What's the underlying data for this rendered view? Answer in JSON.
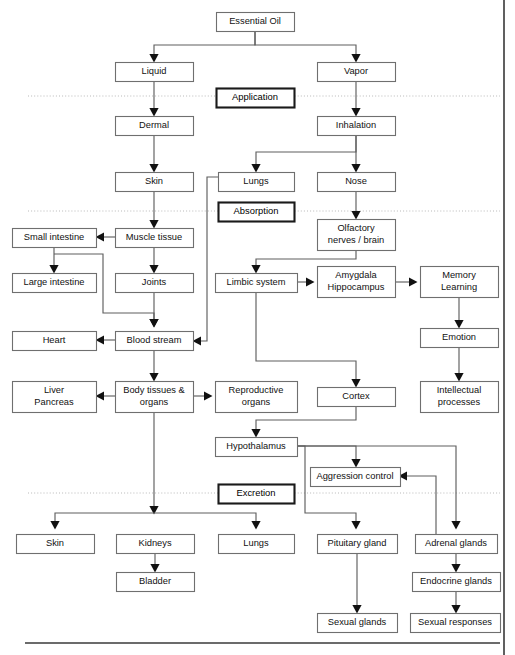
{
  "diagram": {
    "type": "flowchart",
    "canvas": {
      "width": 515,
      "height": 655
    },
    "colors": {
      "background": "#ffffff",
      "node_border": "#6f6f6f",
      "phase_border": "#1a1a1a",
      "link": "#5f5f5f",
      "text": "#111111",
      "divider": "#b9b9b9"
    },
    "nodes": [
      {
        "id": "essential-oil",
        "label": "Essential Oil",
        "x": 216,
        "y": 12,
        "w": 78,
        "h": 19,
        "kind": "node"
      },
      {
        "id": "liquid",
        "label": "Liquid",
        "x": 115,
        "y": 62,
        "w": 78,
        "h": 19,
        "kind": "node"
      },
      {
        "id": "vapor",
        "label": "Vapor",
        "x": 317,
        "y": 62,
        "w": 78,
        "h": 19,
        "kind": "node"
      },
      {
        "id": "application",
        "label": "Application",
        "x": 216,
        "y": 88,
        "w": 78,
        "h": 19,
        "kind": "phase"
      },
      {
        "id": "dermal",
        "label": "Dermal",
        "x": 115,
        "y": 116,
        "w": 78,
        "h": 19,
        "kind": "node"
      },
      {
        "id": "inhalation",
        "label": "Inhalation",
        "x": 317,
        "y": 116,
        "w": 78,
        "h": 19,
        "kind": "node"
      },
      {
        "id": "skin-top",
        "label": "Skin",
        "x": 115,
        "y": 172,
        "w": 78,
        "h": 19,
        "kind": "node"
      },
      {
        "id": "lungs-top",
        "label": "Lungs",
        "x": 218,
        "y": 172,
        "w": 76,
        "h": 19,
        "kind": "node"
      },
      {
        "id": "nose",
        "label": "Nose",
        "x": 317,
        "y": 172,
        "w": 78,
        "h": 19,
        "kind": "node"
      },
      {
        "id": "absorption",
        "label": "Absorption",
        "x": 218,
        "y": 202,
        "w": 76,
        "h": 19,
        "kind": "phase"
      },
      {
        "id": "small-intestine",
        "label": "Small intestine",
        "x": 12,
        "y": 228,
        "w": 84,
        "h": 19,
        "kind": "node"
      },
      {
        "id": "muscle-tissue",
        "label": "Muscle tissue",
        "x": 115,
        "y": 228,
        "w": 78,
        "h": 19,
        "kind": "node"
      },
      {
        "id": "olfactory",
        "label": "Olfactory|nerves / brain",
        "x": 317,
        "y": 219,
        "w": 78,
        "h": 31,
        "kind": "node"
      },
      {
        "id": "large-intestine",
        "label": "Large intestine",
        "x": 12,
        "y": 273,
        "w": 84,
        "h": 19,
        "kind": "node"
      },
      {
        "id": "joints",
        "label": "Joints",
        "x": 115,
        "y": 273,
        "w": 78,
        "h": 19,
        "kind": "node"
      },
      {
        "id": "limbic-system",
        "label": "Limbic system",
        "x": 215,
        "y": 273,
        "w": 82,
        "h": 19,
        "kind": "node"
      },
      {
        "id": "amygdala",
        "label": "Amygdala|Hippocampus",
        "x": 317,
        "y": 266,
        "w": 78,
        "h": 31,
        "kind": "node"
      },
      {
        "id": "memory-learning",
        "label": "Memory|Learning",
        "x": 420,
        "y": 266,
        "w": 78,
        "h": 31,
        "kind": "node"
      },
      {
        "id": "heart",
        "label": "Heart",
        "x": 12,
        "y": 331,
        "w": 84,
        "h": 19,
        "kind": "node"
      },
      {
        "id": "blood-stream",
        "label": "Blood stream",
        "x": 115,
        "y": 331,
        "w": 78,
        "h": 19,
        "kind": "node"
      },
      {
        "id": "emotion",
        "label": "Emotion",
        "x": 420,
        "y": 328,
        "w": 78,
        "h": 19,
        "kind": "node"
      },
      {
        "id": "liver-pancreas",
        "label": "Liver|Pancreas",
        "x": 12,
        "y": 381,
        "w": 84,
        "h": 31,
        "kind": "node"
      },
      {
        "id": "body-tissues",
        "label": "Body tissues &|organs",
        "x": 115,
        "y": 381,
        "w": 78,
        "h": 31,
        "kind": "node"
      },
      {
        "id": "reproductive-organs",
        "label": "Reproductive|organs",
        "x": 215,
        "y": 381,
        "w": 82,
        "h": 31,
        "kind": "node"
      },
      {
        "id": "cortex",
        "label": "Cortex",
        "x": 317,
        "y": 387,
        "w": 78,
        "h": 19,
        "kind": "node"
      },
      {
        "id": "intellectual",
        "label": "Intellectual|processes",
        "x": 420,
        "y": 381,
        "w": 78,
        "h": 31,
        "kind": "node"
      },
      {
        "id": "hypothalamus",
        "label": "Hypothalamus",
        "x": 215,
        "y": 437,
        "w": 82,
        "h": 19,
        "kind": "node"
      },
      {
        "id": "aggression-control",
        "label": "Aggression control",
        "x": 310,
        "y": 467,
        "w": 90,
        "h": 19,
        "kind": "node"
      },
      {
        "id": "excretion",
        "label": "Excretion",
        "x": 218,
        "y": 484,
        "w": 76,
        "h": 19,
        "kind": "phase"
      },
      {
        "id": "skin-bottom",
        "label": "Skin",
        "x": 16,
        "y": 534,
        "w": 78,
        "h": 19,
        "kind": "node"
      },
      {
        "id": "kidneys",
        "label": "Kidneys",
        "x": 116,
        "y": 534,
        "w": 78,
        "h": 19,
        "kind": "node"
      },
      {
        "id": "lungs-bottom",
        "label": "Lungs",
        "x": 218,
        "y": 534,
        "w": 76,
        "h": 19,
        "kind": "node"
      },
      {
        "id": "pituitary-gland",
        "label": "Pituitary gland",
        "x": 317,
        "y": 534,
        "w": 80,
        "h": 19,
        "kind": "node"
      },
      {
        "id": "adrenal-glands",
        "label": "Adrenal glands",
        "x": 415,
        "y": 534,
        "w": 82,
        "h": 19,
        "kind": "node"
      },
      {
        "id": "bladder",
        "label": "Bladder",
        "x": 116,
        "y": 572,
        "w": 78,
        "h": 19,
        "kind": "node"
      },
      {
        "id": "endocrine-glands",
        "label": "Endocrine glands",
        "x": 412,
        "y": 572,
        "w": 88,
        "h": 19,
        "kind": "node"
      },
      {
        "id": "sexual-glands",
        "label": "Sexual glands",
        "x": 317,
        "y": 613,
        "w": 80,
        "h": 19,
        "kind": "node"
      },
      {
        "id": "sexual-responses",
        "label": "Sexual responses",
        "x": 410,
        "y": 613,
        "w": 90,
        "h": 19,
        "kind": "node"
      }
    ],
    "phase_labels": [
      "Application",
      "Absorption",
      "Excretion"
    ],
    "dividers": [
      {
        "id": "divider-application",
        "y": 96,
        "x1": 28,
        "x2": 500
      },
      {
        "id": "divider-absorption",
        "y": 211,
        "x1": 28,
        "x2": 500
      },
      {
        "id": "divider-excretion",
        "y": 493,
        "x1": 28,
        "x2": 500
      }
    ],
    "edges": [
      {
        "from": "essential-oil",
        "to": "liquid",
        "path": "M255,31 L255,45 L154,45 L154,56",
        "arrow": "down",
        "ax": 154,
        "ay": 61
      },
      {
        "from": "essential-oil",
        "to": "vapor",
        "path": "M255,31 L255,45 L356,45 L356,56",
        "arrow": "down",
        "ax": 356,
        "ay": 61
      },
      {
        "from": "liquid",
        "to": "dermal",
        "path": "M154,81 L154,110",
        "arrow": "down",
        "ax": 154,
        "ay": 115
      },
      {
        "from": "vapor",
        "to": "inhalation",
        "path": "M356,81 L356,110",
        "arrow": "down",
        "ax": 356,
        "ay": 115
      },
      {
        "from": "dermal",
        "to": "skin-top",
        "path": "M154,135 L154,166",
        "arrow": "down",
        "ax": 154,
        "ay": 171
      },
      {
        "from": "inhalation",
        "to": "nose",
        "path": "M356,135 L356,166",
        "arrow": "down",
        "ax": 356,
        "ay": 171
      },
      {
        "from": "inhalation",
        "to": "lungs-top",
        "path": "M356,135 L356,152 L256,152 L256,166",
        "arrow": "down",
        "ax": 256,
        "ay": 171
      },
      {
        "from": "skin-top",
        "to": "muscle-tissue",
        "path": "M154,191 L154,222",
        "arrow": "down",
        "ax": 154,
        "ay": 227
      },
      {
        "from": "nose",
        "to": "olfactory",
        "path": "M356,191 L356,213",
        "arrow": "down",
        "ax": 356,
        "ay": 218
      },
      {
        "from": "muscle-tissue",
        "to": "small-intestine",
        "path": "M115,237 L102,237",
        "arrow": "left",
        "ax": 97,
        "ay": 237
      },
      {
        "from": "muscle-tissue",
        "to": "joints",
        "path": "M154,247 L154,267",
        "arrow": "down",
        "ax": 154,
        "ay": 272
      },
      {
        "from": "small-intestine",
        "to": "large-intestine",
        "path": "M54,247 L54,267",
        "arrow": "down",
        "ax": 54,
        "ay": 272
      },
      {
        "from": "small-intestine",
        "to": "blood-stream",
        "path": "M54,254 L103,254 L103,313 L154,313 L154,321",
        "arrow": "down",
        "ax": 154,
        "ay": 326
      },
      {
        "from": "joints",
        "to": "blood-stream",
        "path": "M154,292 L154,321",
        "arrow": "down",
        "ax": 154,
        "ay": 326
      },
      {
        "from": "lungs-top",
        "to": "blood-stream",
        "path": "M218,177 L207,177 L207,341 L199,341",
        "arrow": "left",
        "ax": 194,
        "ay": 341
      },
      {
        "from": "blood-stream",
        "to": "heart",
        "path": "M115,340 L102,340",
        "arrow": "left",
        "ax": 97,
        "ay": 340
      },
      {
        "from": "blood-stream",
        "to": "body-tissues",
        "path": "M154,350 L154,375",
        "arrow": "down",
        "ax": 154,
        "ay": 380
      },
      {
        "from": "olfactory",
        "to": "limbic-system",
        "path": "M356,250 L356,259 L256,259 L256,267",
        "arrow": "down",
        "ax": 256,
        "ay": 272
      },
      {
        "from": "limbic-system",
        "to": "amygdala",
        "path": "M297,282 L308,282",
        "arrow": "right",
        "ax": 313,
        "ay": 282
      },
      {
        "from": "amygdala",
        "to": "memory-learning",
        "path": "M395,282 L411,282",
        "arrow": "right",
        "ax": 416,
        "ay": 282
      },
      {
        "from": "memory-learning",
        "to": "emotion",
        "path": "M459,297 L459,322",
        "arrow": "down",
        "ax": 459,
        "ay": 327
      },
      {
        "from": "emotion",
        "to": "intellectual",
        "path": "M459,347 L459,375",
        "arrow": "down",
        "ax": 459,
        "ay": 380
      },
      {
        "from": "limbic-system",
        "to": "cortex",
        "path": "M256,292 L256,361 L356,361 L356,381",
        "arrow": "down",
        "ax": 356,
        "ay": 386
      },
      {
        "from": "body-tissues",
        "to": "liver-pancreas",
        "path": "M115,396 L102,396",
        "arrow": "left",
        "ax": 97,
        "ay": 396
      },
      {
        "from": "body-tissues",
        "to": "reproductive-organs",
        "path": "M193,396 L206,396",
        "arrow": "right",
        "ax": 211,
        "ay": 396
      },
      {
        "from": "body-tissues",
        "to": "excretion-branch",
        "path": "M154,412 L154,508",
        "arrow": "down",
        "ax": 154,
        "ay": 513
      },
      {
        "from": "cortex",
        "to": "hypothalamus",
        "path": "M356,406 L356,420 L256,420 L256,431",
        "arrow": "down",
        "ax": 256,
        "ay": 436
      },
      {
        "from": "hypothalamus",
        "to": "aggression-control",
        "path": "M297,446 L356,446 L356,461",
        "arrow": "down",
        "ax": 356,
        "ay": 466
      },
      {
        "from": "hypothalamus",
        "to": "pituitary-gland",
        "path": "M297,446 L305,446 L305,513 L356,513 L356,528",
        "arrow": "down",
        "ax": 356,
        "ay": 528
      },
      {
        "from": "hypothalamus",
        "to": "adrenal-glands",
        "path": "M297,446 L456,446 L456,528",
        "arrow": "down",
        "ax": 456,
        "ay": 528
      },
      {
        "from": "adrenal-glands",
        "to": "aggression-control",
        "path": "M436,534 L436,476 L405,476",
        "arrow": "left",
        "ax": 400,
        "ay": 476
      },
      {
        "from": "body-tissues-branch",
        "to": "skin-bottom",
        "path": "M154,513 L55,513 L55,528",
        "arrow": "down",
        "ax": 55,
        "ay": 528
      },
      {
        "from": "body-tissues-branch",
        "to": "lungs-bottom",
        "path": "M154,513 L256,513 L256,528",
        "arrow": "down",
        "ax": 256,
        "ay": 528
      },
      {
        "from": "kidneys",
        "to": "bladder",
        "path": "M155,553 L155,566",
        "arrow": "down",
        "ax": 155,
        "ay": 571
      },
      {
        "from": "pituitary-gland",
        "to": "sexual-glands",
        "path": "M357,553 L357,607",
        "arrow": "down",
        "ax": 357,
        "ay": 612
      },
      {
        "from": "adrenal-glands",
        "to": "endocrine-glands",
        "path": "M456,553 L456,566",
        "arrow": "down",
        "ax": 456,
        "ay": 571
      },
      {
        "from": "endocrine-glands",
        "to": "sexual-responses",
        "path": "M456,591 L456,607",
        "arrow": "down",
        "ax": 456,
        "ay": 612
      }
    ],
    "page_rule": {
      "y": 643,
      "x1": 25,
      "x2": 500
    },
    "page_edge": {
      "x": 504,
      "y1": 0,
      "y2": 655
    }
  }
}
